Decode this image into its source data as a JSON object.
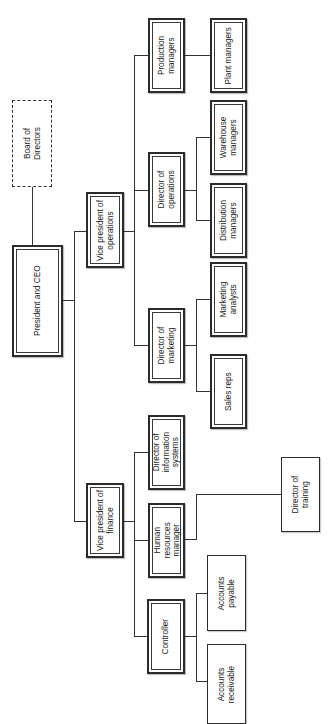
{
  "chart": {
    "orientation": "rotated -90 degrees (hierarchy flows left to right on screen)",
    "nodes": [
      {
        "id": "board",
        "label": "Board of\nDirectors",
        "style": "dashed",
        "x": 12,
        "y": 100,
        "w": 40,
        "h": 87
      },
      {
        "id": "ceo",
        "label": "President and CEO",
        "style": "double",
        "x": 12,
        "y": 245,
        "w": 51,
        "h": 112
      },
      {
        "id": "vp_ops",
        "label": "Vice president of\noperations",
        "style": "double",
        "x": 86,
        "y": 192,
        "w": 38,
        "h": 76
      },
      {
        "id": "vp_fin",
        "label": "Vice president of\nfinance",
        "style": "double",
        "x": 86,
        "y": 483,
        "w": 38,
        "h": 75
      },
      {
        "id": "prod_mgr",
        "label": "Production\nmanagers",
        "style": "double",
        "x": 148,
        "y": 18,
        "w": 37,
        "h": 75
      },
      {
        "id": "dir_ops",
        "label": "Director of\noperations",
        "style": "double",
        "x": 148,
        "y": 152,
        "w": 37,
        "h": 75
      },
      {
        "id": "dir_mkt",
        "label": "Director of\nmarketing",
        "style": "double",
        "x": 148,
        "y": 308,
        "w": 37,
        "h": 75
      },
      {
        "id": "dir_is",
        "label": "Director of\ninformation\nsystems",
        "style": "double",
        "x": 148,
        "y": 415,
        "w": 37,
        "h": 75
      },
      {
        "id": "hr_mgr",
        "label": "Human\nresources\nmanager",
        "style": "double",
        "x": 148,
        "y": 503,
        "w": 37,
        "h": 75
      },
      {
        "id": "controller",
        "label": "Controller",
        "style": "double",
        "x": 147,
        "y": 599,
        "w": 38,
        "h": 75
      },
      {
        "id": "plant_mgr",
        "label": "Plant managers",
        "style": "double",
        "x": 210,
        "y": 18,
        "w": 37,
        "h": 75
      },
      {
        "id": "warehouse",
        "label": "Warehouse\nmanagers",
        "style": "double",
        "x": 210,
        "y": 100,
        "w": 37,
        "h": 75
      },
      {
        "id": "distrib",
        "label": "Distribution\nmanagers",
        "style": "double",
        "x": 210,
        "y": 183,
        "w": 37,
        "h": 75
      },
      {
        "id": "mkt_analyst",
        "label": "Marketing\nanalysts",
        "style": "double",
        "x": 210,
        "y": 262,
        "w": 37,
        "h": 75
      },
      {
        "id": "sales_reps",
        "label": "Sales reps",
        "style": "double",
        "x": 210,
        "y": 354,
        "w": 37,
        "h": 75
      },
      {
        "id": "dir_train",
        "label": "Director of\ntraining",
        "style": "single",
        "x": 281,
        "y": 457,
        "w": 39,
        "h": 75
      },
      {
        "id": "acct_pay",
        "label": "Accounts\npayable",
        "style": "single",
        "x": 207,
        "y": 555,
        "w": 39,
        "h": 76
      },
      {
        "id": "acct_rec",
        "label": "Accounts\nreceivable",
        "style": "single",
        "x": 207,
        "y": 644,
        "w": 39,
        "h": 80
      }
    ],
    "edges": [
      [
        "board",
        "ceo"
      ],
      [
        "ceo",
        "vp_ops"
      ],
      [
        "ceo",
        "vp_fin"
      ],
      [
        "vp_ops",
        "prod_mgr"
      ],
      [
        "vp_ops",
        "dir_ops"
      ],
      [
        "vp_ops",
        "dir_mkt"
      ],
      [
        "prod_mgr",
        "plant_mgr"
      ],
      [
        "dir_ops",
        "warehouse"
      ],
      [
        "dir_ops",
        "distrib"
      ],
      [
        "dir_mkt",
        "mkt_analyst"
      ],
      [
        "dir_mkt",
        "sales_reps"
      ],
      [
        "vp_fin",
        "dir_is"
      ],
      [
        "vp_fin",
        "hr_mgr"
      ],
      [
        "vp_fin",
        "controller"
      ],
      [
        "hr_mgr",
        "dir_train"
      ],
      [
        "controller",
        "acct_pay"
      ],
      [
        "controller",
        "acct_rec"
      ]
    ],
    "lines": [
      {
        "t": "v",
        "x": 32,
        "y": 187,
        "len": 58
      },
      {
        "t": "h",
        "x": 63,
        "y": 300,
        "len": 11
      },
      {
        "t": "v",
        "x": 74,
        "y": 231,
        "len": 291
      },
      {
        "t": "h",
        "x": 74,
        "y": 231,
        "len": 12
      },
      {
        "t": "h",
        "x": 74,
        "y": 521,
        "len": 12
      },
      {
        "t": "h",
        "x": 124,
        "y": 231,
        "len": 10
      },
      {
        "t": "v",
        "x": 134,
        "y": 55,
        "len": 291
      },
      {
        "t": "h",
        "x": 134,
        "y": 55,
        "len": 14
      },
      {
        "t": "h",
        "x": 134,
        "y": 190,
        "len": 14
      },
      {
        "t": "h",
        "x": 134,
        "y": 345,
        "len": 14
      },
      {
        "t": "h",
        "x": 185,
        "y": 55,
        "len": 25
      },
      {
        "t": "h",
        "x": 185,
        "y": 190,
        "len": 11
      },
      {
        "t": "v",
        "x": 196,
        "y": 137,
        "len": 84
      },
      {
        "t": "h",
        "x": 196,
        "y": 137,
        "len": 14
      },
      {
        "t": "h",
        "x": 196,
        "y": 220,
        "len": 14
      },
      {
        "t": "h",
        "x": 185,
        "y": 345,
        "len": 11
      },
      {
        "t": "v",
        "x": 196,
        "y": 299,
        "len": 93
      },
      {
        "t": "h",
        "x": 196,
        "y": 299,
        "len": 14
      },
      {
        "t": "h",
        "x": 196,
        "y": 391,
        "len": 14
      },
      {
        "t": "h",
        "x": 124,
        "y": 521,
        "len": 10
      },
      {
        "t": "v",
        "x": 134,
        "y": 452,
        "len": 185
      },
      {
        "t": "h",
        "x": 134,
        "y": 452,
        "len": 14
      },
      {
        "t": "h",
        "x": 134,
        "y": 540,
        "len": 14
      },
      {
        "t": "h",
        "x": 134,
        "y": 636,
        "len": 13
      },
      {
        "t": "h",
        "x": 185,
        "y": 539,
        "len": 11
      },
      {
        "t": "v",
        "x": 196,
        "y": 494,
        "len": 46
      },
      {
        "t": "h",
        "x": 196,
        "y": 494,
        "len": 85
      },
      {
        "t": "h",
        "x": 185,
        "y": 636,
        "len": 11
      },
      {
        "t": "v",
        "x": 196,
        "y": 593,
        "len": 89
      },
      {
        "t": "h",
        "x": 196,
        "y": 593,
        "len": 11
      },
      {
        "t": "h",
        "x": 196,
        "y": 681,
        "len": 11
      }
    ]
  }
}
